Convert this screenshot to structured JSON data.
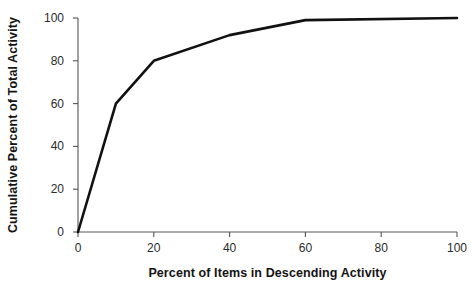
{
  "chart_data": {
    "type": "line",
    "title": "",
    "subtitle": "",
    "xlabel": "Percent of Items in Descending Activity",
    "ylabel": "Cumulative Percent of Total Activity",
    "xlim": [
      0,
      100
    ],
    "ylim": [
      0,
      100
    ],
    "xticks": [
      0,
      20,
      40,
      60,
      80,
      100
    ],
    "yticks": [
      0,
      20,
      40,
      60,
      80,
      100
    ],
    "xticklabels": [
      "0",
      "20",
      "40",
      "60",
      "80",
      "100"
    ],
    "yticklabels": [
      "0",
      "20",
      "40",
      "60",
      "80",
      "100"
    ],
    "grid": false,
    "legend": false,
    "legend_position": "none",
    "line_color": "#111111",
    "line_width": 2.6,
    "axis_color": "#555555",
    "series": [
      {
        "name": "Cumulative activity",
        "x": [
          0,
          10,
          20,
          40,
          60,
          100
        ],
        "values": [
          0,
          60,
          80,
          92,
          99,
          100
        ]
      }
    ]
  },
  "axes": {
    "x_label_text": "Percent of Items in Descending Activity",
    "y_label_text": "Cumulative Percent of Total Activity"
  }
}
